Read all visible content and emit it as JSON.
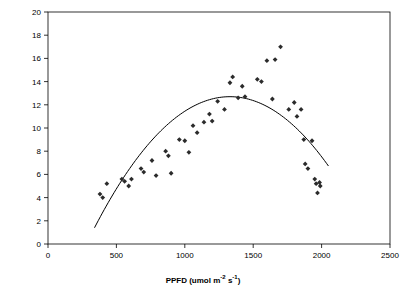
{
  "chart_data": {
    "type": "scatter",
    "title": "",
    "xlabel": "PPFD (umol m-2 s-1)",
    "ylabel": "Net Photosynthesis (umol m-2 s-1)",
    "xlim": [
      0,
      2500
    ],
    "ylim": [
      0,
      20
    ],
    "xticks": [
      0,
      500,
      1000,
      1500,
      2000,
      2500
    ],
    "yticks": [
      0,
      2,
      4,
      6,
      8,
      10,
      12,
      14,
      16,
      18,
      20
    ],
    "grid": false,
    "legend": "none",
    "marker": "diamond",
    "marker_color": "#2b2b2b",
    "line_color": "#000000",
    "points": [
      {
        "x": 380,
        "y": 4.3
      },
      {
        "x": 400,
        "y": 4.0
      },
      {
        "x": 430,
        "y": 5.2
      },
      {
        "x": 540,
        "y": 5.6
      },
      {
        "x": 560,
        "y": 5.4
      },
      {
        "x": 590,
        "y": 5.0
      },
      {
        "x": 610,
        "y": 5.6
      },
      {
        "x": 680,
        "y": 6.5
      },
      {
        "x": 700,
        "y": 6.2
      },
      {
        "x": 760,
        "y": 7.2
      },
      {
        "x": 790,
        "y": 5.9
      },
      {
        "x": 860,
        "y": 8.0
      },
      {
        "x": 880,
        "y": 7.6
      },
      {
        "x": 900,
        "y": 6.1
      },
      {
        "x": 960,
        "y": 9.0
      },
      {
        "x": 1000,
        "y": 8.9
      },
      {
        "x": 1030,
        "y": 7.9
      },
      {
        "x": 1060,
        "y": 10.2
      },
      {
        "x": 1090,
        "y": 9.6
      },
      {
        "x": 1140,
        "y": 10.5
      },
      {
        "x": 1180,
        "y": 11.2
      },
      {
        "x": 1200,
        "y": 10.6
      },
      {
        "x": 1240,
        "y": 12.3
      },
      {
        "x": 1290,
        "y": 11.6
      },
      {
        "x": 1330,
        "y": 13.9
      },
      {
        "x": 1350,
        "y": 14.4
      },
      {
        "x": 1390,
        "y": 12.6
      },
      {
        "x": 1420,
        "y": 13.6
      },
      {
        "x": 1440,
        "y": 12.7
      },
      {
        "x": 1530,
        "y": 14.2
      },
      {
        "x": 1560,
        "y": 14.0
      },
      {
        "x": 1600,
        "y": 15.8
      },
      {
        "x": 1640,
        "y": 12.5
      },
      {
        "x": 1660,
        "y": 15.9
      },
      {
        "x": 1700,
        "y": 17.0
      },
      {
        "x": 1760,
        "y": 11.6
      },
      {
        "x": 1800,
        "y": 12.2
      },
      {
        "x": 1820,
        "y": 11.0
      },
      {
        "x": 1850,
        "y": 11.6
      },
      {
        "x": 1870,
        "y": 9.0
      },
      {
        "x": 1880,
        "y": 6.9
      },
      {
        "x": 1900,
        "y": 6.5
      },
      {
        "x": 1930,
        "y": 8.9
      },
      {
        "x": 1950,
        "y": 5.6
      },
      {
        "x": 1960,
        "y": 5.2
      },
      {
        "x": 1970,
        "y": 4.4
      },
      {
        "x": 1985,
        "y": 5.3
      },
      {
        "x": 1990,
        "y": 5.0
      }
    ],
    "fit_curve": {
      "type": "quadratic",
      "x_start": 340,
      "x_end": 2050,
      "vertex_x": 1330,
      "vertex_y": 12.7,
      "y_at_x_start": 1.4,
      "y_at_x_end": 6.6
    }
  },
  "axis": {
    "x_labels": [
      "0",
      "500",
      "1000",
      "1500",
      "2000",
      "2500"
    ],
    "y_labels": [
      "0",
      "2",
      "4",
      "6",
      "8",
      "10",
      "12",
      "14",
      "16",
      "18",
      "20"
    ],
    "x_title_main": "PPFD (umol m",
    "x_title_sup1": "-2",
    "x_title_mid": " s",
    "x_title_sup2": "-1",
    "x_title_end": ")",
    "y_title_main": "Net Photosynthesis (umol m",
    "y_title_sup1": "-2",
    "y_title_mid": " s",
    "y_title_sup2": "-1",
    "y_title_end": ")"
  }
}
